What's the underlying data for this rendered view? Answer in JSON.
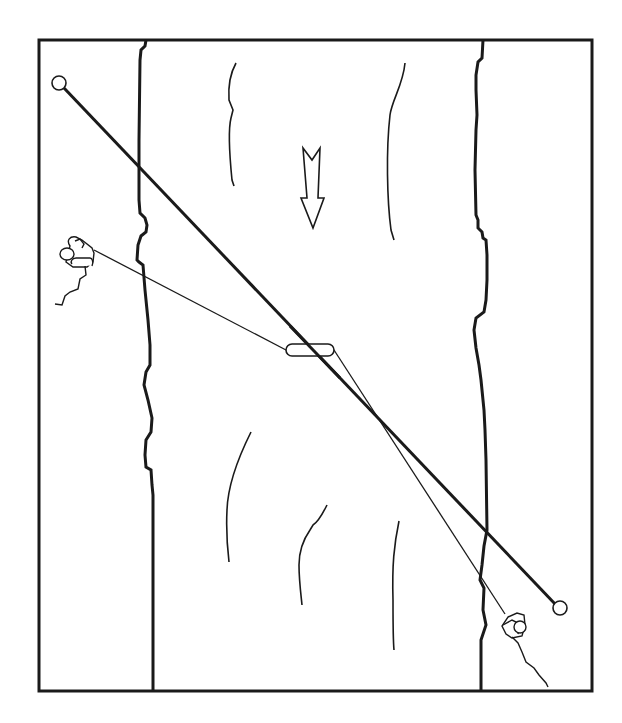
{
  "diagram": {
    "title": "River crossing with tensioned line and tethered swimmer",
    "elements": {
      "frame": "border",
      "banks": [
        "left-riverbank",
        "right-riverbank"
      ],
      "current_arrow": "downstream-arrow",
      "anchors": [
        "anchor-upper-left",
        "anchor-lower-right"
      ],
      "main_line": "diagonal-tensioned-rope",
      "tether_lines": [
        "belay-line-left",
        "belay-line-right"
      ],
      "carabiner": "rope-sling",
      "people": [
        "belayer-left-bank",
        "belayer-right-bank"
      ]
    },
    "colors": {
      "stroke": "#1a1a1a",
      "background": "#ffffff"
    }
  }
}
